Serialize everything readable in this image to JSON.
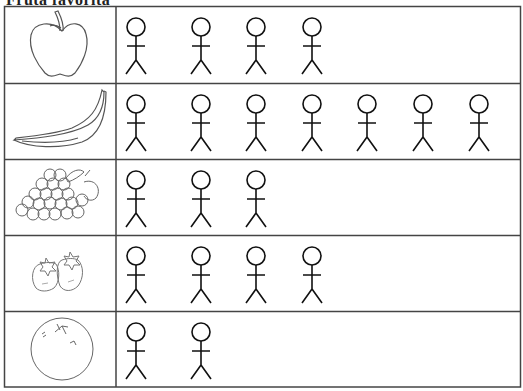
{
  "title": "Fruta favorita",
  "table": {
    "rows": [
      {
        "fruit": "apple",
        "icon": "apple-icon",
        "count": 4
      },
      {
        "fruit": "banana",
        "icon": "banana-icon",
        "count": 7
      },
      {
        "fruit": "grapes",
        "icon": "grapes-icon",
        "count": 3
      },
      {
        "fruit": "strawberries",
        "icon": "strawberry-icon",
        "count": 4
      },
      {
        "fruit": "orange",
        "icon": "orange-icon",
        "count": 2
      }
    ]
  },
  "chart_data": {
    "type": "table",
    "title": "Fruta favorita",
    "categories": [
      "apple",
      "banana",
      "grapes",
      "strawberries",
      "orange"
    ],
    "values": [
      4,
      7,
      3,
      4,
      2
    ],
    "unit": "stick figure = 1 person",
    "xlabel": "",
    "ylabel": ""
  }
}
